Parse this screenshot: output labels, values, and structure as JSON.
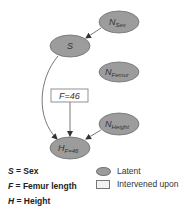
{
  "colors": {
    "latent_fill": "#9c9c9c",
    "latent_stroke": "#6f6f6f",
    "box_fill": "#ffffff",
    "box_stroke": "#777777",
    "edge": "#555555"
  },
  "nodes": {
    "n_sex": {
      "main": "N",
      "sub": "Sex"
    },
    "s": {
      "main": "S",
      "sub": ""
    },
    "n_femur": {
      "main": "N",
      "sub": "Femur"
    },
    "f": {
      "label": "F=46"
    },
    "n_height": {
      "main": "N",
      "sub": "Height"
    },
    "h": {
      "main": "H",
      "sub": "F=46"
    }
  },
  "edges": [
    {
      "from": "N_Sex",
      "to": "S"
    },
    {
      "from": "S",
      "to": "H_F=46"
    },
    {
      "from": "F=46",
      "to": "H_F=46"
    },
    {
      "from": "N_Height",
      "to": "H_F=46"
    }
  ],
  "legend": {
    "variables": [
      {
        "symbol": "S",
        "text": " = Sex"
      },
      {
        "symbol": "F",
        "text": " = Femur length"
      },
      {
        "symbol": "H",
        "text": " = Height"
      }
    ],
    "keys": [
      {
        "shape": "ellipse",
        "label": "Latent"
      },
      {
        "shape": "box",
        "label": "Intervened upon"
      }
    ]
  }
}
